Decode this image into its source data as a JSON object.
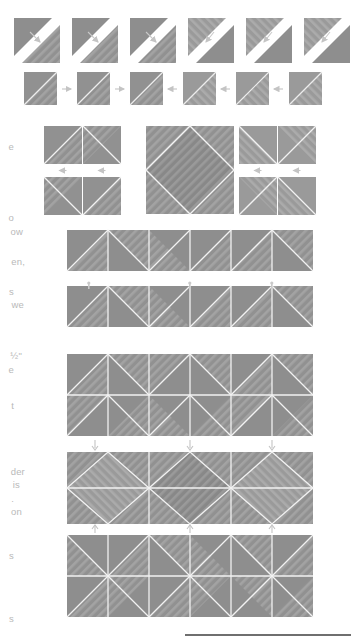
{
  "document": {
    "type": "quilting-instruction-diagram",
    "title": "Half-square triangle block assembly diagram",
    "page_background": "#ffffff"
  },
  "colors": {
    "fabric_dark": "#8e8e8e",
    "fabric_light": "#a8a8a8",
    "fabric_mid": "#9c9c9c",
    "seam_white": "#ffffff",
    "stripe_overlay": "#b4b4b4",
    "arrow": "#c8c8c8",
    "text": "#bbbbbb",
    "rule_dark": "#6f6f6f",
    "rule_light": "#d8d8d8"
  },
  "margin_text": {
    "note": "Body text is cropped at the left page edge; only the final letters of each line remain visible.",
    "fragments": [
      {
        "text": "e",
        "x": 14,
        "y": 141
      },
      {
        "text": "o",
        "x": 14,
        "y": 212
      },
      {
        "text": "ow",
        "x": 23,
        "y": 226
      },
      {
        "text": "en,",
        "x": 25,
        "y": 256
      },
      {
        "text": "s",
        "x": 14,
        "y": 286
      },
      {
        "text": "we",
        "x": 24,
        "y": 299
      },
      {
        "text": "½\"",
        "x": 22,
        "y": 350
      },
      {
        "text": "e",
        "x": 14,
        "y": 364
      },
      {
        "text": "t",
        "x": 14,
        "y": 400
      },
      {
        "text": "der",
        "x": 25,
        "y": 466
      },
      {
        "text": "is",
        "x": 20,
        "y": 479
      },
      {
        "text": ".",
        "x": 14,
        "y": 493
      },
      {
        "text": "on",
        "x": 22,
        "y": 506
      },
      {
        "text": "s",
        "x": 14,
        "y": 550
      },
      {
        "text": "s",
        "x": 14,
        "y": 613
      }
    ]
  },
  "figures": {
    "row1": {
      "name": "Step 1 — stitched squares trimmed on the diagonal",
      "label": "trim-diagonal-row",
      "count": 6,
      "arrow_direction": "diagonal",
      "y": 18,
      "unit_size": 45,
      "x_positions": [
        14,
        72,
        130,
        188,
        246,
        304
      ]
    },
    "row2": {
      "name": "Step 2 — pressed half-square triangle units",
      "label": "pressed-hst-row",
      "count": 6,
      "unit_size": 33,
      "y": 72,
      "x_positions": [
        24,
        77,
        130,
        183,
        236,
        289
      ],
      "connector_arrows": [
        "right",
        "right",
        "left",
        "left",
        "left"
      ]
    },
    "row3": {
      "name": "Step 3 — four-unit pairs flanking the finished diamond block",
      "left_pair_top": {
        "x": 44,
        "y": 126,
        "unit": 38
      },
      "left_pair_bottom": {
        "x": 44,
        "y": 177,
        "unit": 38
      },
      "right_pair_top": {
        "x": 239,
        "y": 126,
        "unit": 38
      },
      "right_pair_bottom": {
        "x": 239,
        "y": 177,
        "unit": 38
      },
      "center_block": {
        "x": 146,
        "y": 126,
        "size": 88,
        "name": "square-in-a-square-block"
      },
      "arrows": [
        "down",
        "down",
        "down",
        "down"
      ]
    },
    "row4": {
      "name": "Step 4 — top assembly strip",
      "x": 67,
      "y": 230,
      "unit": 41,
      "count": 6
    },
    "row5": {
      "name": "Step 5 — second assembly strip",
      "x": 67,
      "y": 286,
      "unit": 41,
      "count": 6,
      "pin_markers": 3
    },
    "row6": {
      "name": "Step 6 — joined double-row unit",
      "x": 67,
      "y": 354,
      "unit": 41,
      "count": 6,
      "rows": 2,
      "arrows_below": [
        "down",
        "down",
        "down"
      ]
    },
    "row7": {
      "name": "Step 7 — center diamond row",
      "x": 67,
      "y": 452,
      "unit": 41,
      "count": 6,
      "center_diamond": true,
      "arrows_below": [
        "up",
        "up",
        "up"
      ]
    },
    "row8": {
      "name": "Step 8 — final chevron double row",
      "x": 67,
      "y": 535,
      "unit": 41,
      "count": 6,
      "rows": 2
    }
  },
  "footer_rule": {
    "x": 185,
    "y": 634,
    "width": 166
  }
}
